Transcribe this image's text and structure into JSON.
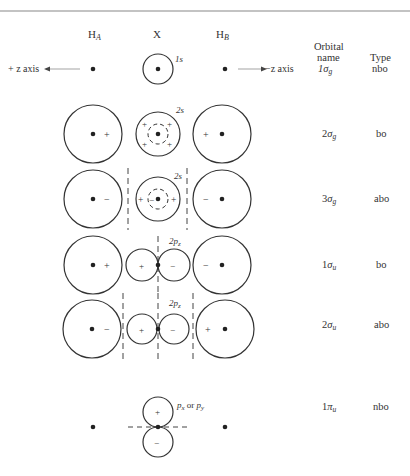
{
  "headers": {
    "ha": "H",
    "ha_sub": "A",
    "x": "X",
    "hb": "H",
    "hb_sub": "B",
    "orbital_name_line1": "Orbital",
    "orbital_name_line2": "name",
    "type": "Type"
  },
  "axes": {
    "plus_z": "+ z axis",
    "minus_z": "−z axis"
  },
  "rows": [
    {
      "x_label": "1s",
      "orbital": "1",
      "orbital_greek": "σ",
      "orbital_sub": "g",
      "type": "nbo",
      "ha_sign": "",
      "hb_sign": ""
    },
    {
      "x_label": "2s",
      "orbital": "2",
      "orbital_greek": "σ",
      "orbital_sub": "g",
      "type": "bo",
      "ha_sign": "+",
      "hb_sign": "+",
      "x_signs": [
        "+",
        "+",
        "+",
        "+"
      ]
    },
    {
      "x_label": "2s",
      "orbital": "3",
      "orbital_greek": "σ",
      "orbital_sub": "g",
      "type": "abo",
      "ha_sign": "−",
      "hb_sign": "−",
      "x_signs": [
        "+",
        "−",
        "+"
      ]
    },
    {
      "x_label": "2p",
      "x_label_sub": "z",
      "orbital": "1",
      "orbital_greek": "σ",
      "orbital_sub": "u",
      "type": "bo",
      "ha_sign": "+",
      "hb_sign": "−",
      "x_signs": [
        "+",
        "−"
      ]
    },
    {
      "x_label": "2p",
      "x_label_sub": "z",
      "orbital": "2",
      "orbital_greek": "σ",
      "orbital_sub": "u",
      "type": "abo",
      "ha_sign": "−",
      "hb_sign": "+",
      "x_signs": [
        "+",
        "−"
      ]
    },
    {
      "x_label": "p",
      "x_label_sub": "x",
      "x_label_mid": " or ",
      "x_label2": "p",
      "x_label2_sub": "y",
      "orbital": "1",
      "orbital_greek": "π",
      "orbital_sub": "u",
      "type": "nbo",
      "x_signs": [
        "+",
        "−"
      ]
    }
  ]
}
